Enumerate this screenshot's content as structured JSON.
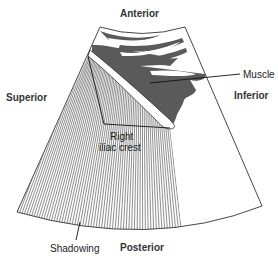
{
  "figure": {
    "type": "ultrasound sector schematic",
    "labels": {
      "anterior": "Anterior",
      "posterior": "Posterior",
      "superior": "Superior",
      "inferior": "Inferior",
      "muscle": "Muscle",
      "crest_line1": "Right",
      "crest_line2": "iliac crest",
      "shadowing": "Shadowing"
    },
    "colors": {
      "outline": "#333333",
      "muscle_fill": "#5a5a5a",
      "hatching": "#444444",
      "background": "#ffffff"
    }
  }
}
